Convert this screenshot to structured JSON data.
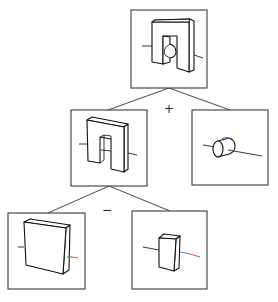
{
  "diagram": {
    "type": "CSG tree",
    "nodes": [
      {
        "id": "root",
        "label": "bracket with cylinder hole (result)",
        "box": [
          131,
          10,
          76,
          78
        ]
      },
      {
        "id": "arch",
        "label": "U-shaped arch",
        "box": [
          71,
          110,
          76,
          76
        ]
      },
      {
        "id": "cylinder",
        "label": "cylinder",
        "box": [
          192,
          110,
          76,
          75
        ]
      },
      {
        "id": "slab",
        "label": "rectangular slab",
        "box": [
          8,
          213,
          77,
          76
        ]
      },
      {
        "id": "block",
        "label": "small block",
        "box": [
          132,
          211,
          75,
          78
        ]
      }
    ],
    "operators": {
      "union": "+",
      "difference": "−"
    },
    "edges": [
      {
        "from": "root",
        "to": "arch"
      },
      {
        "from": "root",
        "to": "cylinder"
      },
      {
        "from": "arch",
        "to": "slab"
      },
      {
        "from": "arch",
        "to": "block"
      }
    ],
    "colors": {
      "line": "#222222",
      "axis_highlight_green": "#3a9a5a",
      "axis_highlight_red": "#d0603a",
      "axis_highlight_blue": "#4a8ad0"
    }
  }
}
